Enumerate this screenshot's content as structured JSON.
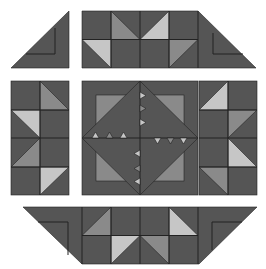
{
  "colors": {
    "background": "#ffffff",
    "dark": "#555555",
    "medium": "#8a8a8a",
    "light": "#c6c6c6",
    "line": "#222222"
  },
  "pieces": {
    "top_left_corner": {
      "points": "11,68 69,11 69,68",
      "inner_line": "55,28 55,54 26,54"
    },
    "top_strip": {
      "points": "82,11 198,11 256,68 82,68",
      "grid_lines": [
        "82,39.5 198,39.5",
        "111,11 111,68",
        "140,11 140,68",
        "169,11 169,68",
        "198,11 198,68"
      ],
      "inner_line": "213,33 213,54 243,54",
      "triangles": [
        {
          "points": "111,11 111,39.5 140,39.5",
          "tone": "medium"
        },
        {
          "points": "169,11 169,39.5 140,39.5",
          "tone": "light"
        },
        {
          "points": "82,39.5 111,39.5 111,68",
          "tone": "light"
        },
        {
          "points": "169,39.5 198,39.5 169,68",
          "tone": "medium"
        }
      ]
    },
    "left_strip": {
      "rect": [
        11,
        81,
        58,
        114
      ],
      "grid_lines": [
        "40,81 40,195",
        "11,110 69,110",
        "11,138 69,138",
        "11,167 69,167"
      ],
      "triangles": [
        {
          "points": "40,81 40,110 69,110",
          "tone": "medium"
        },
        {
          "points": "11,110 40,110 40,138",
          "tone": "light"
        },
        {
          "points": "40,138 40,167 11,167",
          "tone": "medium"
        },
        {
          "points": "40,167 69,167 40,195",
          "tone": "light"
        }
      ]
    },
    "right_strip": {
      "rect": [
        199,
        81,
        58,
        114
      ],
      "grid_lines": [
        "228,81 228,195",
        "199,110 257,110",
        "199,138 257,138",
        "199,167 257,167"
      ],
      "triangles": [
        {
          "points": "228,81 228,110 199,110",
          "tone": "light"
        },
        {
          "points": "228,110 257,110 228,138",
          "tone": "medium"
        },
        {
          "points": "228,138 228,167 257,167",
          "tone": "light"
        },
        {
          "points": "199,167 228,167 228,195",
          "tone": "medium"
        }
      ]
    },
    "center_block": {
      "rect": [
        82,
        81,
        116,
        114
      ],
      "inner_square": [
        96,
        95,
        88,
        86
      ],
      "diamond": "140,81 198,138 140,195 82,138",
      "cross_lines": [
        "140,81 140,195",
        "82,138 198,138"
      ],
      "sawtooth": [
        {
          "points": "140,92 146,95.5 140,99",
          "tone": "light"
        },
        {
          "points": "140,105 146,108.5 140,112",
          "tone": "medium"
        },
        {
          "points": "140,119 146,122.5 140,126",
          "tone": "light"
        },
        {
          "points": "140,150 134,153.5 140,157",
          "tone": "light"
        },
        {
          "points": "140,165 134,168.5 140,172",
          "tone": "medium"
        },
        {
          "points": "140,178 134,181.5 140,185",
          "tone": "light"
        },
        {
          "points": "92,138 95.5,132 99,138",
          "tone": "light"
        },
        {
          "points": "106,138 109.5,132 113,138",
          "tone": "medium"
        },
        {
          "points": "120,138 123.5,132 127,138",
          "tone": "light"
        },
        {
          "points": "154,138 157.5,144 161,138",
          "tone": "light"
        },
        {
          "points": "167,138 170.5,144 174,138",
          "tone": "medium"
        },
        {
          "points": "180,138 183.5,144 187,138",
          "tone": "light"
        }
      ]
    },
    "bottom_strip": {
      "points": "23,207 257,207 199,264 82,264",
      "grid_lines": [
        "82,207 82,264",
        "198,207 198,264",
        "82,235.5 198,235.5",
        "111,207 111,264",
        "140,207 140,264",
        "169,207 169,264"
      ],
      "inner_lines": [
        "38,222 68,222 68,255",
        "242,222 212,222 212,250"
      ],
      "triangles": [
        {
          "points": "111,207 111,235.5 82,235.5",
          "tone": "medium"
        },
        {
          "points": "169,207 169,235.5 198,235.5",
          "tone": "light"
        },
        {
          "points": "111,235.5 140,235.5 111,264",
          "tone": "light"
        },
        {
          "points": "140,235.5 169,235.5 169,264",
          "tone": "medium"
        }
      ]
    }
  }
}
